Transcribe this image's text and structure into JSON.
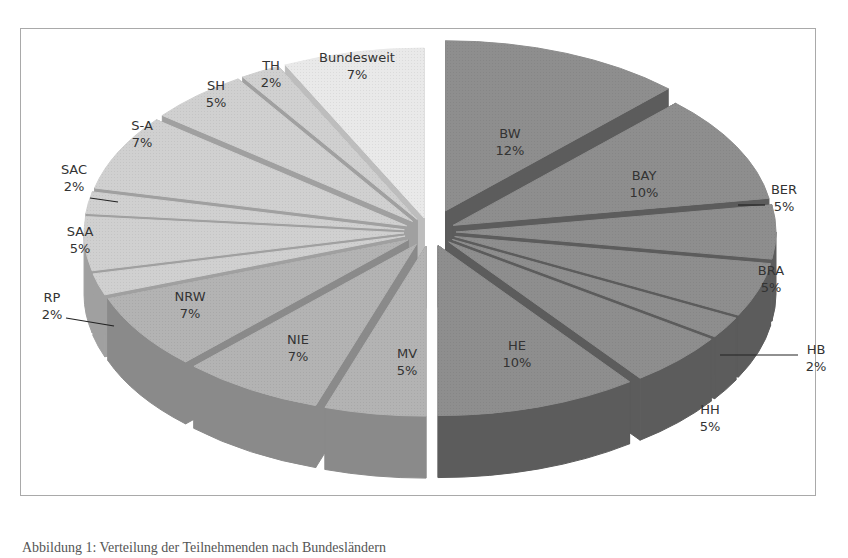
{
  "chart_data": {
    "type": "pie",
    "variant": "3d-exploded",
    "title": "",
    "categories": [
      "BW",
      "BAY",
      "BER",
      "BRA",
      "HB",
      "HH",
      "HE",
      "MV",
      "NIE",
      "NRW",
      "RP",
      "SAA",
      "SAC",
      "S-A",
      "SH",
      "TH",
      "Bundesweit"
    ],
    "values": [
      12,
      10,
      5,
      5,
      2,
      5,
      10,
      5,
      7,
      7,
      2,
      5,
      2,
      7,
      5,
      2,
      7
    ],
    "labels": [
      {
        "name": "BW",
        "pct": "12%"
      },
      {
        "name": "BAY",
        "pct": "10%"
      },
      {
        "name": "BER",
        "pct": "5%"
      },
      {
        "name": "BRA",
        "pct": "5%"
      },
      {
        "name": "HB",
        "pct": "2%"
      },
      {
        "name": "HH",
        "pct": "5%"
      },
      {
        "name": "HE",
        "pct": "10%"
      },
      {
        "name": "MV",
        "pct": "5%"
      },
      {
        "name": "NIE",
        "pct": "7%"
      },
      {
        "name": "NRW",
        "pct": "7%"
      },
      {
        "name": "RP",
        "pct": "2%"
      },
      {
        "name": "SAA",
        "pct": "5%"
      },
      {
        "name": "SAC",
        "pct": "2%"
      },
      {
        "name": "S-A",
        "pct": "7%"
      },
      {
        "name": "SH",
        "pct": "5%"
      },
      {
        "name": "TH",
        "pct": "2%"
      },
      {
        "name": "Bundesweit",
        "pct": "7%"
      }
    ],
    "colors": {
      "dark": "#6e6e6e",
      "mid": "#9a9a9a",
      "light": "#c4c4c4",
      "lightest": "#e2e2e2"
    },
    "legend": "none"
  },
  "caption": "Abbildung 1: Verteilung der Teilnehmenden nach Bundesländern"
}
